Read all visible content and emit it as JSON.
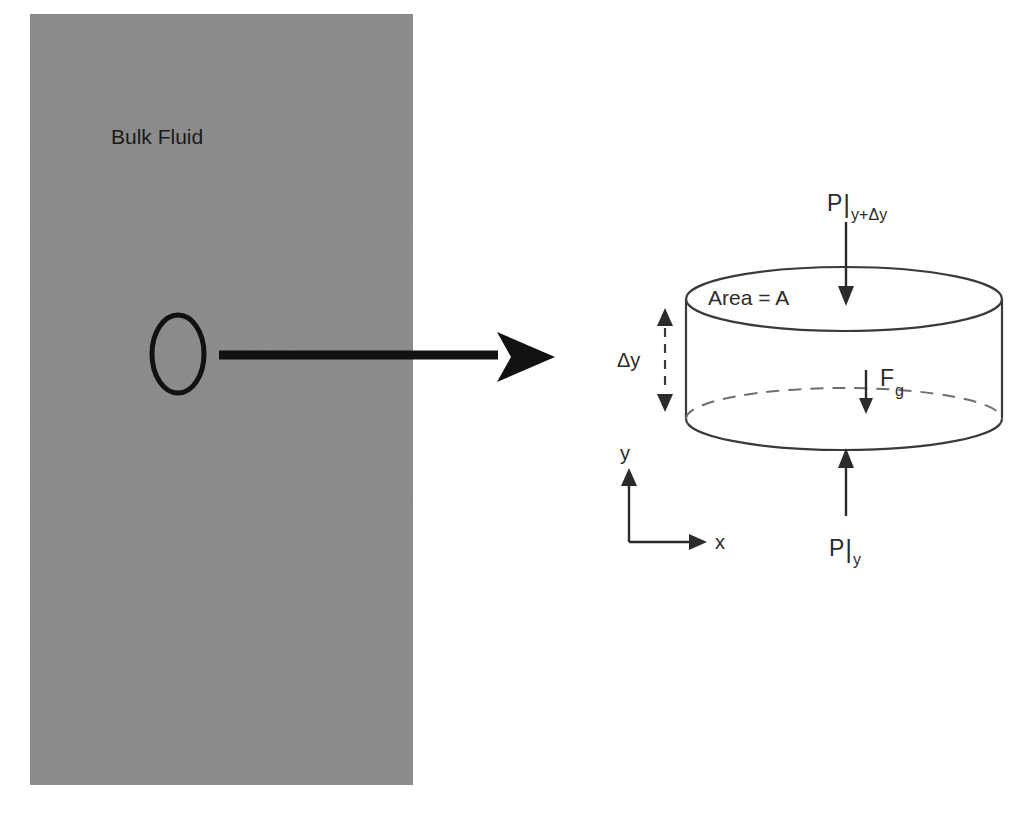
{
  "figure": {
    "background_color": "#ffffff"
  },
  "bulk_region": {
    "label": "Bulk Fluid",
    "fill_color": "#888888",
    "x": 30,
    "y": 14,
    "width": 383,
    "height": 771
  },
  "callout": {
    "ellipse_name": "fluid-element-marker",
    "arrow_name": "zoom-callout-arrow"
  },
  "cylinder": {
    "area_label": "Area = A",
    "outline_color": "#3a3a3a"
  },
  "forces": {
    "top_pressure": {
      "symbol": "P",
      "bar": "|",
      "subscript": "y+Δy"
    },
    "bottom_pressure": {
      "symbol": "P",
      "bar": "|",
      "subscript": "y"
    },
    "gravity": {
      "symbol": "F",
      "subscript": "g"
    }
  },
  "thickness": {
    "label": "Δy"
  },
  "axes": {
    "y_label": "y",
    "x_label": "x"
  }
}
